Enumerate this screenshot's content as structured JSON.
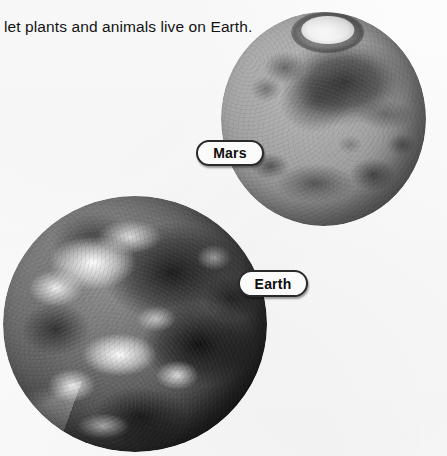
{
  "page": {
    "background_color": "#fdfdfd",
    "width": 447,
    "height": 456
  },
  "body_text": {
    "paragraph": "let plants and animals live on Earth.",
    "color": "#131313"
  },
  "figure": {
    "planets": [
      {
        "id": "mars",
        "name": "Mars",
        "appearance": "grayscale photograph of Mars with bright white north polar ice cap and dark albedo markings",
        "polar_cap": "white",
        "base_color": "#9b9b9b",
        "marking_color": "#2a2a2a"
      },
      {
        "id": "earth",
        "name": "Earth",
        "appearance": "grayscale photograph of Earth showing swirling white cloud systems over dark oceans and landmasses",
        "base_color": "#5e5e5e",
        "cloud_color": "#fbfbfb"
      }
    ],
    "callouts": [
      {
        "id": "mars",
        "label": "Mars",
        "border_color": "#2a2a2a",
        "fill_color": "#fbfbfb",
        "text_color": "#0d0d0d"
      },
      {
        "id": "earth",
        "label": "Earth",
        "border_color": "#2a2a2a",
        "fill_color": "#fbfbfb",
        "text_color": "#0d0d0d"
      }
    ]
  }
}
